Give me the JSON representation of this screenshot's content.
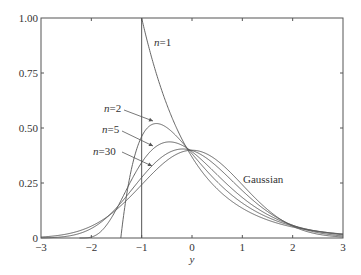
{
  "chart_data": {
    "type": "line",
    "title": "",
    "xlabel": "y",
    "ylabel": "",
    "xlim": [
      -3,
      3
    ],
    "ylim": [
      0,
      1.0
    ],
    "grid": false,
    "x_ticks": [
      -3,
      -2,
      -1,
      0,
      1,
      2,
      3
    ],
    "x_tick_labels": [
      "−3",
      "−2",
      "−1",
      "0",
      "1",
      "2",
      "3"
    ],
    "y_ticks": [
      0,
      0.25,
      0.5,
      0.75,
      1.0
    ],
    "y_tick_labels": [
      "0",
      "0.25",
      "0.50",
      "0.75",
      "1.00"
    ],
    "reference_line": {
      "x": -1
    },
    "series": [
      {
        "name": "n=1",
        "shape": 1,
        "label": "n=1",
        "peak": [
          -1.0,
          1.0
        ]
      },
      {
        "name": "n=2",
        "shape": 2,
        "label": "n=2",
        "peak": [
          -0.71,
          0.52
        ]
      },
      {
        "name": "n=5",
        "shape": 5,
        "label": "n=5",
        "peak": [
          -0.45,
          0.44
        ]
      },
      {
        "name": "n=30",
        "shape": 30,
        "label": "n=30",
        "peak": [
          -0.18,
          0.4
        ]
      },
      {
        "name": "Gaussian",
        "shape": null,
        "label": "Gaussian",
        "peak": [
          0.0,
          0.399
        ]
      }
    ],
    "annotations": [
      {
        "text_var": "n",
        "text_rest": "=1",
        "target": "n=1"
      },
      {
        "text_var": "n",
        "text_rest": "=2",
        "target": "n=2",
        "arrow": true
      },
      {
        "text_var": "n",
        "text_rest": "=5",
        "target": "n=5",
        "arrow": true
      },
      {
        "text_var": "n",
        "text_rest": "=30",
        "target": "n=30",
        "arrow": true
      },
      {
        "text": "Gaussian",
        "target": "Gaussian"
      }
    ]
  }
}
